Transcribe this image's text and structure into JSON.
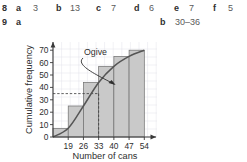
{
  "answers": {
    "row8": {
      "question": "8",
      "parts": [
        {
          "letter": "a",
          "value": "3"
        },
        {
          "letter": "b",
          "value": "13"
        },
        {
          "letter": "c",
          "value": "7"
        },
        {
          "letter": "d",
          "value": "6"
        },
        {
          "letter": "e",
          "value": "7"
        },
        {
          "letter": "f",
          "value": "5"
        }
      ]
    },
    "row9": {
      "question": "9",
      "parts": [
        {
          "letter": "a",
          "value": ""
        },
        {
          "letter": "b",
          "value": "30–36"
        }
      ]
    }
  },
  "chart_data": {
    "type": "bar",
    "title": "",
    "xlabel": "Number of cans",
    "ylabel": "Cumulative frequency",
    "categories": [
      "19",
      "26",
      "33",
      "40",
      "47",
      "54"
    ],
    "values": [
      7,
      25,
      44,
      57,
      65,
      70
    ],
    "series": [
      {
        "name": "Cumulative frequency",
        "values": [
          7,
          25,
          44,
          57,
          65,
          70
        ]
      }
    ],
    "ogive": {
      "label": "Ogive",
      "points": [
        {
          "x": 12,
          "y": 0
        },
        {
          "x": 19,
          "y": 7
        },
        {
          "x": 26,
          "y": 25
        },
        {
          "x": 33,
          "y": 44
        },
        {
          "x": 40,
          "y": 57
        },
        {
          "x": 47,
          "y": 65
        },
        {
          "x": 54,
          "y": 70
        }
      ]
    },
    "median_guides": {
      "y_value": 35,
      "x_value": 33
    },
    "xlim": [
      12,
      58
    ],
    "ylim": [
      0,
      75
    ],
    "yticks": [
      0,
      10,
      20,
      30,
      40,
      50,
      60,
      70
    ],
    "xticks": [
      19,
      26,
      33,
      40,
      47,
      54
    ],
    "grid": true,
    "legend": "none",
    "colors": {
      "bar_fill": "#c9c9c9",
      "bar_stroke": "#6e6e6e",
      "curve": "#555555",
      "axis": "#3a3a3a",
      "grid": "#e3e3ea"
    }
  }
}
